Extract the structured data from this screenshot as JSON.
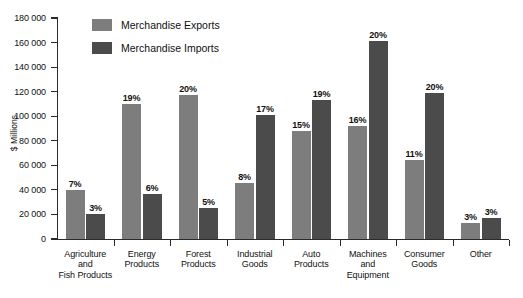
{
  "chart_data": {
    "type": "bar",
    "title": "",
    "subtitle": "",
    "xlabel": "",
    "ylabel": "$ Millions",
    "ylim": [
      0,
      180000
    ],
    "ytick_step": 20000,
    "grid": false,
    "legend_position": "top-left",
    "categories": [
      "Agriculture and Fish Products",
      "Energy Products",
      "Forest Products",
      "Industrial Goods",
      "Auto Products",
      "Machines and Equipment",
      "Consumer Goods",
      "Other"
    ],
    "category_lines": [
      [
        "Agriculture",
        "and",
        "Fish Products"
      ],
      [
        "Energy",
        "Products"
      ],
      [
        "Forest",
        "Products"
      ],
      [
        "Industrial",
        "Goods"
      ],
      [
        "Auto",
        "Products"
      ],
      [
        "Machines",
        "and",
        "Equipment"
      ],
      [
        "Consumer",
        "Goods"
      ],
      [
        "Other"
      ]
    ],
    "ytick_labels": [
      "0",
      "20 000",
      "40 000",
      "60 000",
      "80 000",
      "100 000",
      "120 000",
      "140 000",
      "160 000",
      "180 000"
    ],
    "ytick_values": [
      0,
      20000,
      40000,
      60000,
      80000,
      100000,
      120000,
      140000,
      160000,
      180000
    ],
    "series": [
      {
        "name": "Merchandise Exports",
        "color": "#7d7d7d",
        "values": [
          40000,
          110000,
          117000,
          46000,
          88000,
          92000,
          64000,
          13000
        ],
        "labels": [
          "7%",
          "19%",
          "20%",
          "8%",
          "15%",
          "16%",
          "11%",
          "3%"
        ]
      },
      {
        "name": "Merchandise Imports",
        "color": "#4b4b4b",
        "values": [
          20000,
          37000,
          25000,
          101000,
          113000,
          161000,
          119000,
          17000
        ],
        "labels": [
          "3%",
          "6%",
          "5%",
          "17%",
          "19%",
          "20%",
          "20%",
          "3%"
        ]
      }
    ]
  },
  "legend": {
    "items": [
      {
        "label": "Merchandise Exports",
        "color": "#7d7d7d"
      },
      {
        "label": "Merchandise Imports",
        "color": "#4b4b4b"
      }
    ]
  },
  "axis": {
    "y_title": "$ Millions"
  },
  "colors": {
    "exports": "#7d7d7d",
    "imports": "#4b4b4b",
    "axis": "#2a2a2a",
    "text": "#111111",
    "background": "#ffffff"
  }
}
